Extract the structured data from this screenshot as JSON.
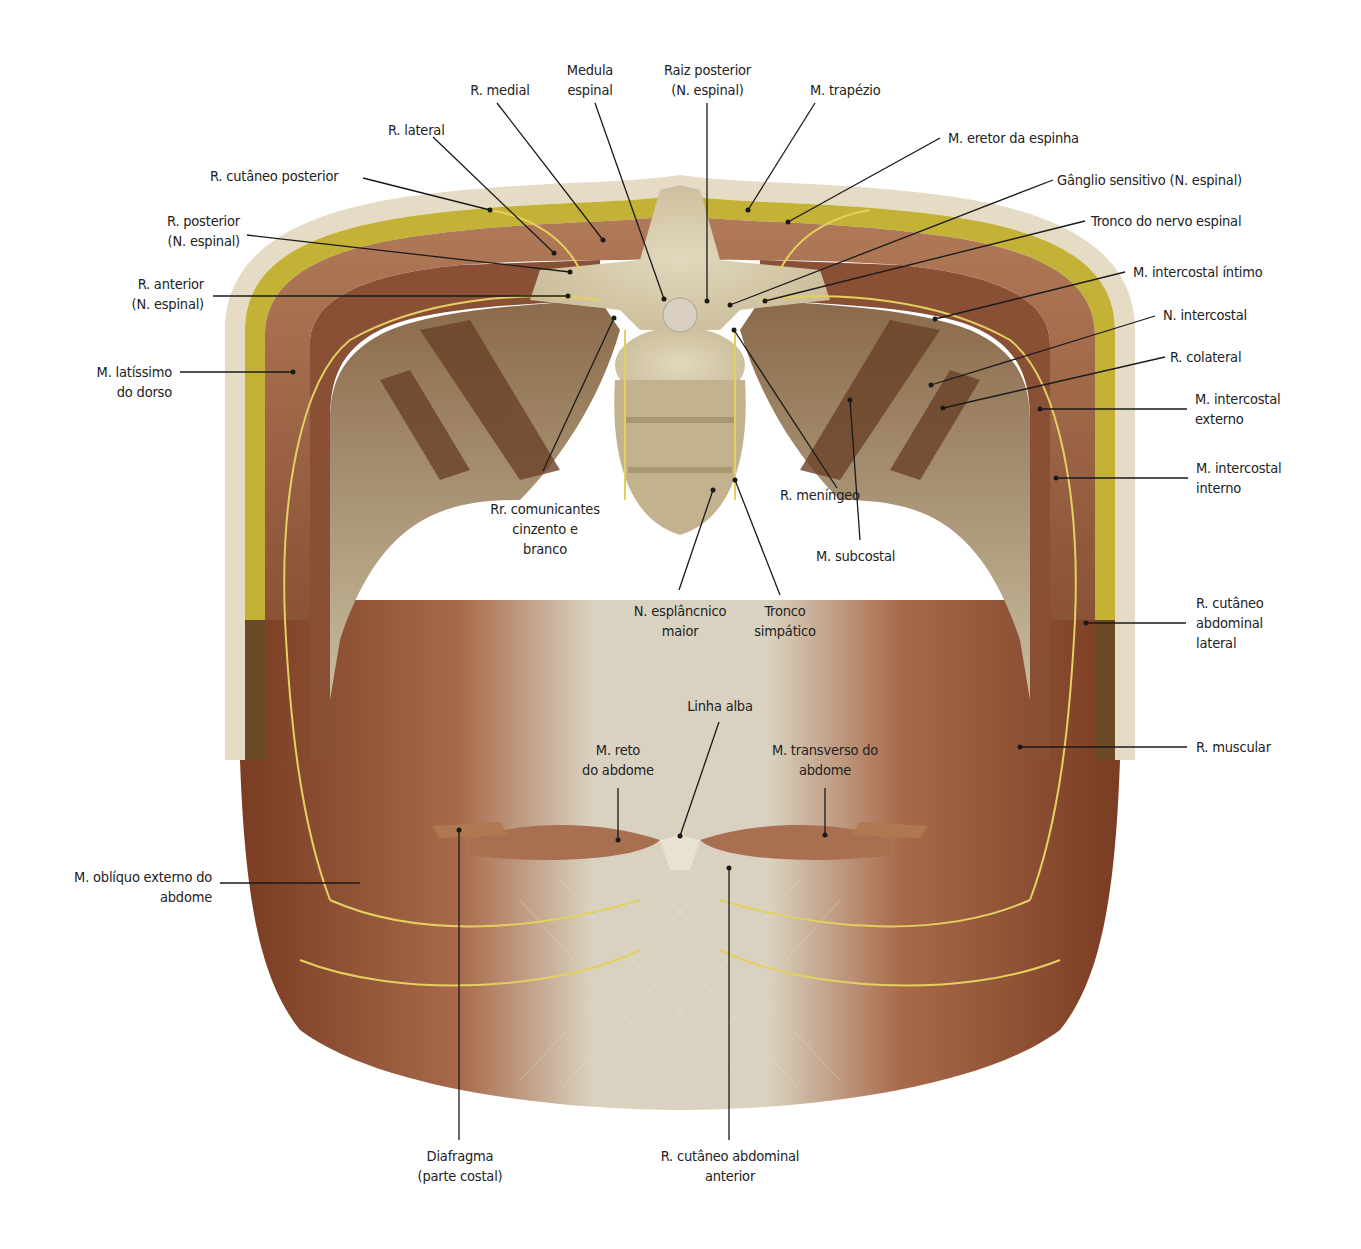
{
  "figure": {
    "colors": {
      "skin": "#e8dcc4",
      "fat": "#c9b83a",
      "muscle": "#a8704f",
      "muscle_dark": "#7a4228",
      "bone": "#d8cdb0",
      "nerve": "#e0cf5a",
      "aponeurosis": "#d6d0bd",
      "leader": "#1a1a1a"
    }
  },
  "labels": {
    "r_medial": [
      "R. medial"
    ],
    "medula_espinal": [
      "Medula",
      "espinal"
    ],
    "raiz_posterior": [
      "Raiz posterior",
      "(N. espinal)"
    ],
    "m_trapezio": [
      "M. trapézio"
    ],
    "r_lateral": [
      "R. lateral"
    ],
    "m_eretor": [
      "M. eretor da espinha"
    ],
    "r_cutaneo_posterior": [
      "R. cutâneo posterior"
    ],
    "ganglio_sensitivo": [
      "Gânglio sensitivo (N. espinal)"
    ],
    "r_posterior": [
      "R. posterior",
      "(N. espinal)"
    ],
    "tronco_nervo_espinal": [
      "Tronco do nervo espinal"
    ],
    "r_anterior": [
      "R. anterior",
      "(N. espinal)"
    ],
    "m_intercostal_intimo": [
      "M. intercostal íntimo"
    ],
    "n_intercostal": [
      "N. intercostal"
    ],
    "m_latissimo": [
      "M. latíssimo",
      "do dorso"
    ],
    "r_colateral": [
      "R. colateral"
    ],
    "m_intercostal_externo": [
      "M. intercostal",
      "externo"
    ],
    "m_intercostal_interno": [
      "M. intercostal",
      "interno"
    ],
    "r_meningeo": [
      "R. meníngeo"
    ],
    "rr_comunicantes": [
      "Rr. comunicantes",
      "cinzento e",
      "branco"
    ],
    "m_subcostal": [
      "M. subcostal"
    ],
    "n_esplancnico": [
      "N. esplâncnico",
      "maior"
    ],
    "tronco_simpatico": [
      "Tronco",
      "simpático"
    ],
    "r_cutaneo_abd_lateral": [
      "R. cutâneo",
      "abdominal",
      "lateral"
    ],
    "linha_alba": [
      "Linha alba"
    ],
    "m_reto": [
      "M. reto",
      "do abdome"
    ],
    "m_transverso": [
      "M. transverso do",
      "abdome"
    ],
    "r_muscular": [
      "R. muscular"
    ],
    "m_obliquo_externo": [
      "M. oblíquo externo do",
      "abdome"
    ],
    "diafragma": [
      "Diafragma",
      "(parte costal)"
    ],
    "r_cutaneo_abd_anterior": [
      "R. cutâneo abdominal",
      "anterior"
    ]
  }
}
